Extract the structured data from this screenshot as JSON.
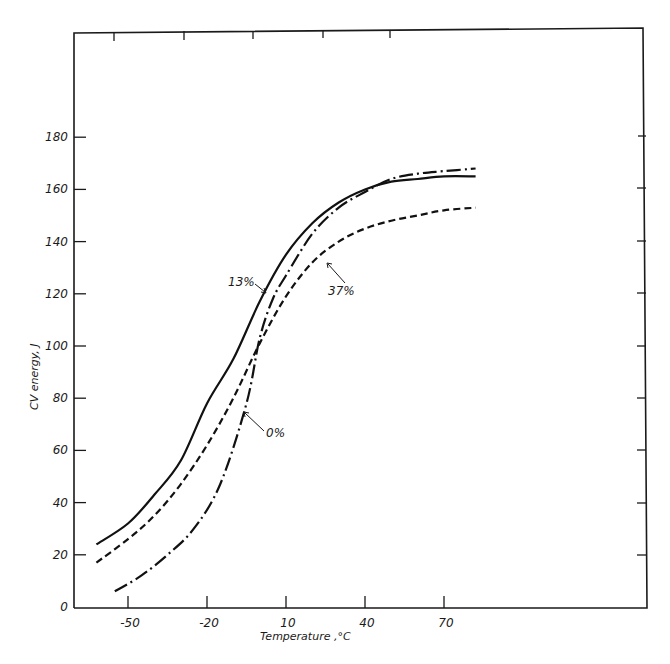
{
  "chart_data": {
    "type": "line",
    "title": "",
    "xlabel": "Temperature ,°C",
    "ylabel": "CV energy, J",
    "xlim": [
      -62,
      82
    ],
    "ylim": [
      0,
      180
    ],
    "grid": false,
    "legend_position": "inline labels with leader lines",
    "x_ticks": [
      -50,
      -20,
      10,
      40,
      70
    ],
    "x_tick_labels": [
      "-50",
      "-20",
      "10",
      "40",
      "70"
    ],
    "y_ticks": [
      0,
      20,
      40,
      60,
      80,
      100,
      120,
      140,
      160,
      180
    ],
    "y_tick_labels": [
      "0",
      "20",
      "40",
      "60",
      "80",
      "100",
      "120",
      "140",
      "160",
      "180"
    ],
    "series": [
      {
        "name": "13%",
        "line_style": "solid",
        "x": [
          -62,
          -50,
          -40,
          -30,
          -20,
          -10,
          0,
          10,
          20,
          30,
          40,
          50,
          60,
          70,
          82
        ],
        "y": [
          24,
          32,
          43,
          56,
          78,
          95,
          117,
          135,
          147,
          155,
          160,
          163,
          164,
          165,
          165
        ]
      },
      {
        "name": "37%",
        "line_style": "dashed",
        "x": [
          -62,
          -50,
          -40,
          -30,
          -20,
          -10,
          0,
          10,
          20,
          30,
          40,
          50,
          60,
          70,
          82
        ],
        "y": [
          17,
          26,
          35,
          47,
          62,
          80,
          101,
          119,
          132,
          140,
          145,
          148,
          150,
          152,
          153
        ]
      },
      {
        "name": "0%",
        "line_style": "dash-dot",
        "x": [
          -55,
          -45,
          -35,
          -25,
          -15,
          -5,
          0,
          5,
          10,
          20,
          30,
          40,
          50,
          60,
          70,
          82
        ],
        "y": [
          6,
          12,
          20,
          30,
          47,
          78,
          103,
          118,
          127,
          143,
          153,
          159,
          164,
          166,
          167,
          168
        ]
      }
    ],
    "annotations": [
      {
        "text": "13%",
        "points_to_series": "13%"
      },
      {
        "text": "37%",
        "points_to_series": "37%"
      },
      {
        "text": "0%",
        "points_to_series": "0%"
      }
    ]
  },
  "labels": {
    "x_axis_title": "Temperature ,°C",
    "y_axis_title": "CV energy, J",
    "series_13": "13%",
    "series_37": "37%",
    "series_0": "0%"
  }
}
